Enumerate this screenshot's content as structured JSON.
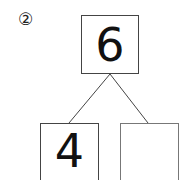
{
  "problem": {
    "number_label": "②",
    "whole": "6",
    "parts": [
      "4",
      ""
    ]
  }
}
